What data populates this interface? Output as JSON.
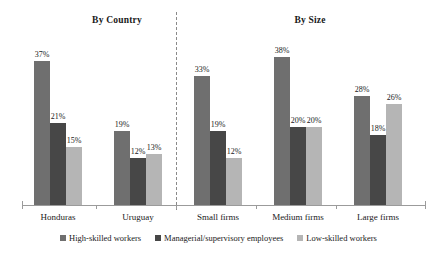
{
  "chart_data": {
    "type": "bar",
    "title": "",
    "panels": [
      {
        "title": "By Country",
        "categories": [
          "Honduras",
          "Uruguay"
        ],
        "series": [
          {
            "name": "High-skilled workers",
            "values": [
              37,
              19
            ],
            "color": "#6f6f6f"
          },
          {
            "name": "Managerial/supervisory employees",
            "values": [
              21,
              12
            ],
            "color": "#474747"
          },
          {
            "name": "Low-skilled workers",
            "values": [
              15,
              13
            ],
            "color": "#b5b5b5"
          }
        ]
      },
      {
        "title": "By Size",
        "categories": [
          "Small firms",
          "Medium firms",
          "Large firms"
        ],
        "series": [
          {
            "name": "High-skilled workers",
            "values": [
              33,
              38,
              28
            ],
            "color": "#6f6f6f"
          },
          {
            "name": "Managerial/supervisory employees",
            "values": [
              19,
              20,
              18
            ],
            "color": "#474747"
          },
          {
            "name": "Low-skilled workers",
            "values": [
              12,
              20,
              26
            ],
            "color": "#b5b5b5"
          }
        ]
      }
    ],
    "data_labels": [
      "37%",
      "21%",
      "15%",
      "19%",
      "12%",
      "13%",
      "33%",
      "19%",
      "12%",
      "38%",
      "20%",
      "20%",
      "28%",
      "18%",
      "26%"
    ],
    "xlabel": "",
    "ylabel": "",
    "ylim": [
      0,
      40
    ],
    "grid": false,
    "legend_position": "bottom",
    "units": "percent"
  },
  "panel_titles": {
    "country": "By Country",
    "size": "By Size"
  },
  "categories": [
    {
      "label": "Honduras"
    },
    {
      "label": "Uruguay"
    },
    {
      "label": "Small firms"
    },
    {
      "label": "Medium firms"
    },
    {
      "label": "Large firms"
    }
  ],
  "bars": [
    {
      "value_label": "37%",
      "value": 37,
      "series": 0,
      "group": 0
    },
    {
      "value_label": "21%",
      "value": 21,
      "series": 1,
      "group": 0
    },
    {
      "value_label": "15%",
      "value": 15,
      "series": 2,
      "group": 0
    },
    {
      "value_label": "19%",
      "value": 19,
      "series": 0,
      "group": 1
    },
    {
      "value_label": "12%",
      "value": 12,
      "series": 1,
      "group": 1
    },
    {
      "value_label": "13%",
      "value": 13,
      "series": 2,
      "group": 1
    },
    {
      "value_label": "33%",
      "value": 33,
      "series": 0,
      "group": 2
    },
    {
      "value_label": "19%",
      "value": 19,
      "series": 1,
      "group": 2
    },
    {
      "value_label": "12%",
      "value": 12,
      "series": 2,
      "group": 2
    },
    {
      "value_label": "38%",
      "value": 38,
      "series": 0,
      "group": 3
    },
    {
      "value_label": "20%",
      "value": 20,
      "series": 1,
      "group": 3
    },
    {
      "value_label": "20%",
      "value": 20,
      "series": 2,
      "group": 3
    },
    {
      "value_label": "28%",
      "value": 28,
      "series": 0,
      "group": 4
    },
    {
      "value_label": "18%",
      "value": 18,
      "series": 1,
      "group": 4
    },
    {
      "value_label": "26%",
      "value": 26,
      "series": 2,
      "group": 4
    }
  ],
  "legend": {
    "items": [
      {
        "label": "High-skilled workers",
        "color": "#6f6f6f"
      },
      {
        "label": "Managerial/supervisory employees",
        "color": "#474747"
      },
      {
        "label": "Low-skilled workers",
        "color": "#b5b5b5"
      }
    ]
  }
}
